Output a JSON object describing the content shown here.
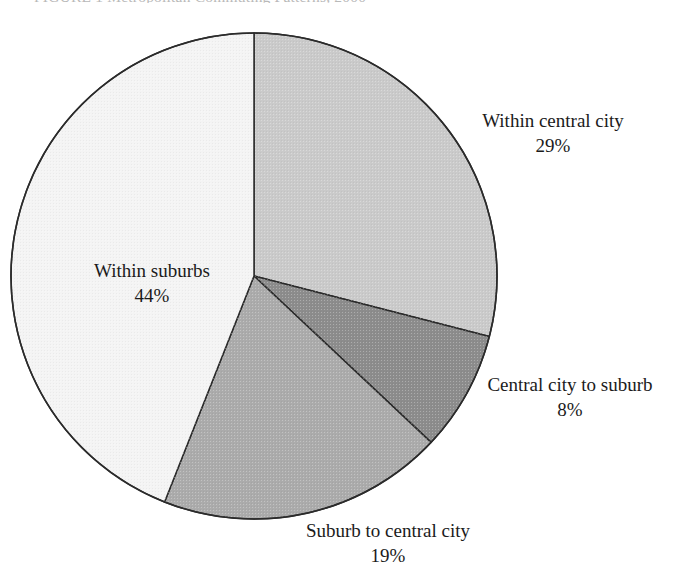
{
  "figure": {
    "title": "FIGURE 1   Metropolitan Commuting Patterns, 2000"
  },
  "chart_data": {
    "type": "pie",
    "title": "FIGURE 1   Metropolitan Commuting Patterns, 2000",
    "xlabel": "",
    "ylabel": "",
    "legend_position": "none",
    "grid": false,
    "start_angle_deg": 0,
    "direction": "clockwise",
    "categories": [
      "Within central city",
      "Central city to suburb",
      "Suburb to central city",
      "Within suburbs"
    ],
    "values": [
      29,
      8,
      19,
      44
    ],
    "value_suffix": "%",
    "labels": [
      "Within central city",
      "Central city to suburb",
      "Suburb to central city",
      "Within suburbs"
    ],
    "value_labels": [
      "29%",
      "8%",
      "19%",
      "44%"
    ],
    "colors": [
      "#cacaca",
      "#8c8c8c",
      "#ababab",
      "#f4f4f4"
    ],
    "slice_outline_color": "#2b2b2b",
    "slices": [
      {
        "name": "Within central city",
        "value": 29,
        "value_label": "29%",
        "color": "#cacaca",
        "start_deg": 0,
        "end_deg": 104.4
      },
      {
        "name": "Central city to suburb",
        "value": 8,
        "value_label": "8%",
        "color": "#8c8c8c",
        "start_deg": 104.4,
        "end_deg": 133.2
      },
      {
        "name": "Suburb to central city",
        "value": 19,
        "value_label": "19%",
        "color": "#ababab",
        "start_deg": 133.2,
        "end_deg": 201.6
      },
      {
        "name": "Within suburbs",
        "value": 44,
        "value_label": "44%",
        "color": "#f4f4f4",
        "start_deg": 201.6,
        "end_deg": 360
      }
    ],
    "geometry": {
      "center_x": 254,
      "center_y": 276,
      "radius": 243
    }
  },
  "labels": {
    "within_central_city": {
      "text": "Within central city",
      "pct": "29%"
    },
    "central_city_to_suburb": {
      "text": "Central city to suburb",
      "pct": "8%"
    },
    "suburb_to_central_city": {
      "text": "Suburb to central city",
      "pct": "19%"
    },
    "within_suburbs": {
      "text": "Within suburbs",
      "pct": "44%"
    }
  }
}
